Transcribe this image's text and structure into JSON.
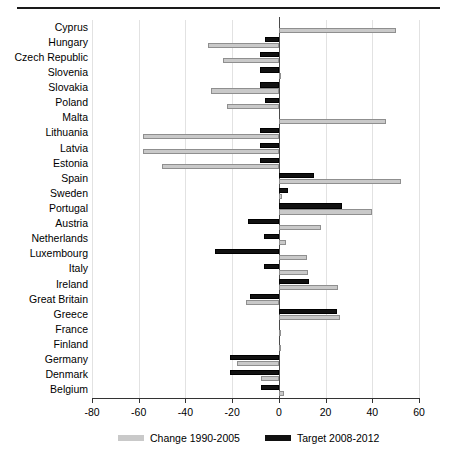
{
  "chart_data": {
    "type": "bar",
    "orientation": "horizontal",
    "title": "",
    "subtitle": "",
    "xlabel": "",
    "ylabel": "",
    "xlim": [
      -80,
      60
    ],
    "xticks": [
      -80,
      -60,
      -40,
      -20,
      0,
      20,
      40,
      60
    ],
    "xtick_labels": [
      "-80",
      "-60",
      "-40",
      "-20",
      "0",
      "20",
      "40",
      "60"
    ],
    "grid": true,
    "grid_axis": "x",
    "legend_position": "bottom",
    "categories": [
      "Cyprus",
      "Hungary",
      "Czech Republic",
      "Slovenia",
      "Slovakia",
      "Poland",
      "Malta",
      "Lithuania",
      "Latvia",
      "Estonia",
      "Spain",
      "Sweden",
      "Portugal",
      "Austria",
      "Netherlands",
      "Luxembourg",
      "Italy",
      "Ireland",
      "Great Britain",
      "Greece",
      "France",
      "Finland",
      "Germany",
      "Denmark",
      "Belgium"
    ],
    "series": [
      {
        "name": "Change 1990-2005",
        "color": "#c9c9c9",
        "values": [
          50,
          -30.5,
          -24,
          0.5,
          -29,
          -22,
          46,
          -58,
          -58,
          -50,
          52.5,
          1.5,
          40,
          18,
          3,
          12,
          12.5,
          25.5,
          -14,
          26,
          1,
          1,
          -18,
          -7.5,
          2
        ]
      },
      {
        "name": "Target 2008-2012",
        "color": "#111111",
        "values": [
          0,
          -6,
          -8,
          -8,
          -8,
          -6,
          0,
          -8,
          -8,
          -8,
          15,
          4,
          27,
          -13,
          -6.5,
          -27.5,
          -6.5,
          13,
          -12.5,
          25,
          0,
          0,
          -21,
          -21,
          -7.5
        ]
      }
    ]
  },
  "legend": {
    "items": [
      {
        "label": "Change 1990-2005",
        "swatch": "gray"
      },
      {
        "label": "Target 2008-2012",
        "swatch": "black"
      }
    ]
  }
}
